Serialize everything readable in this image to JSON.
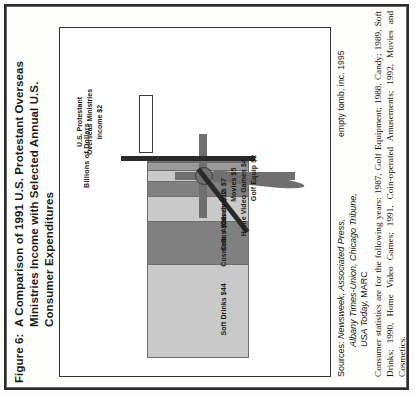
{
  "figure": {
    "number_label": "Figure 6:",
    "caption": "A Comparison of 1991 U.S. Protestant Overseas Ministries Income with Selected Annual U.S. Consumer Expenditures",
    "copyright": "empty tomb, inc. 1995"
  },
  "chart_data": {
    "type": "bar",
    "orientation": "horizontal-stacked",
    "title": "A Comparison of 1991 U.S. Protestant Overseas Ministries Income with Selected Annual U.S. Consumer Expenditures",
    "xlabel": "",
    "ylabel": "Billions of Dollars",
    "axis_label": "Billions of Dollars",
    "units": "Billions of Dollars",
    "grid": false,
    "legend": "none",
    "categories": [
      "Soft Drinks",
      "Cosmetics",
      "Candy",
      "Coin Amusements",
      "Movies",
      "Home Video Games",
      "Golf Equip",
      "U.S. Protestant Overseas Ministries Income"
    ],
    "values": [
      44,
      20,
      12,
      7,
      5,
      4,
      2,
      2
    ],
    "labels": [
      "Soft Drinks $44",
      "Cosmetics $20",
      "Candy $12",
      "Coin Amusements $7",
      "Movies $5",
      "Home Video Games $4",
      "Golf Equip $2",
      "U.S. Protestant Overseas Ministries Income $2"
    ],
    "segment_colors": [
      "#c9c9c9",
      "#808080",
      "#c9c9c9",
      "#808080",
      "#c9c9c9",
      "#9a9a9a",
      "#6f6f6f"
    ],
    "total": 94,
    "annotation": "U.S. Protestant Overseas Ministries Income $2",
    "annotation_lines": [
      "U.S. Protestant",
      "Overseas Ministries",
      "Income $2"
    ]
  },
  "bars": [
    {
      "label": "Soft Drinks $44",
      "value": 44,
      "color": "#c9c9c9"
    },
    {
      "label": "Cosmetics $20",
      "value": 20,
      "color": "#808080"
    },
    {
      "label": "Candy $12",
      "value": 12,
      "color": "#c9c9c9"
    },
    {
      "label": "Coin Amusements $7",
      "value": 7,
      "color": "#808080"
    },
    {
      "label": "Movies $5",
      "value": 5,
      "color": "#c9c9c9"
    },
    {
      "label": "Home Video Games $4",
      "value": 4,
      "color": "#9a9a9a"
    },
    {
      "label": "Golf Equip $2",
      "value": 2,
      "color": "#6f6f6f"
    }
  ],
  "sources": {
    "label": "Sources:",
    "line1": "Newsweek,  Associated  Press,",
    "line2": "Albany Times-Union, Chicago Tribune,",
    "line3_italic": "USA Today,",
    "line3_roman": " MARC"
  },
  "footnote": {
    "text": "Consumer statistics are for the following years: 1987, Golf Equipment; 1988, Candy; 1989, Soft Drinks; 1990, Home Video Games; 1991, Coin-operated Amusements; 1992, Movies and Cosmetics."
  },
  "clipped_bottom_text": "Question 9: How much money is spent on overseas ministries?",
  "colors": {
    "page_background": "#fdfdfb",
    "border": "#2b2b2b",
    "text": "#111111",
    "bar_light": "#c9c9c9",
    "bar_dark": "#808080",
    "axis_dark": "#2a2a2a",
    "cross_gray": "#6f6f6f"
  }
}
